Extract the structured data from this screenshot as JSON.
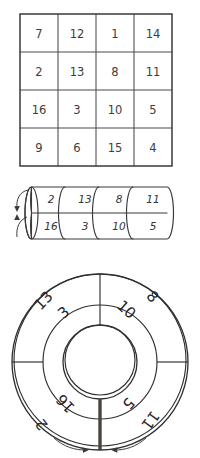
{
  "figure": {
    "ink_color": "#2f2f2f",
    "paper_color": "#ffffff",
    "cap_shade_color": "#b4aca4",
    "seam_color": "#4a4440"
  },
  "magic_square": {
    "name": "4x4 magic square",
    "rows": 4,
    "columns": 4,
    "values": [
      [
        "7",
        "12",
        "1",
        "14"
      ],
      [
        "2",
        "13",
        "8",
        "11"
      ],
      [
        "16",
        "3",
        "10",
        "5"
      ],
      [
        "9",
        "6",
        "15",
        "4"
      ]
    ]
  },
  "cylinder": {
    "name": "cylinder-diagram",
    "segments": 4,
    "top_row": [
      "2",
      "13",
      "8",
      "11"
    ],
    "bottom_row": [
      "16",
      "3",
      "10",
      "5"
    ],
    "cap_label": "shaded-end-cap",
    "arrows": [
      {
        "name": "cap-arrow-down",
        "direction": "down"
      },
      {
        "name": "cap-arrow-up",
        "direction": "up"
      }
    ]
  },
  "torus": {
    "name": "torus-diagram",
    "outer_ring": [
      "13",
      "8",
      "11",
      "2"
    ],
    "inner_ring": [
      "3",
      "10",
      "5",
      "16"
    ],
    "labels": [
      {
        "text": "13",
        "ring": "outer",
        "position": "upper-left"
      },
      {
        "text": "3",
        "ring": "inner",
        "position": "upper-left"
      },
      {
        "text": "8",
        "ring": "outer",
        "position": "upper-right"
      },
      {
        "text": "10",
        "ring": "inner",
        "position": "upper-right"
      },
      {
        "text": "16",
        "ring": "inner",
        "position": "lower-left"
      },
      {
        "text": "2",
        "ring": "outer",
        "position": "lower-left"
      },
      {
        "text": "5",
        "ring": "inner",
        "position": "lower-right"
      },
      {
        "text": "11",
        "ring": "outer",
        "position": "lower-right"
      }
    ],
    "seam": "bottom-vertical-seam",
    "arrows": [
      {
        "name": "torus-arrow-left",
        "direction": "right"
      },
      {
        "name": "torus-arrow-right",
        "direction": "left"
      }
    ]
  }
}
